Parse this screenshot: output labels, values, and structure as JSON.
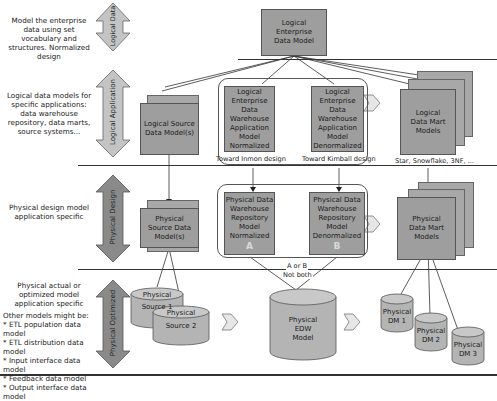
{
  "layers": [
    {
      "id": "logical-data",
      "arrow_label": "Logical Data",
      "arrow_color": "#c4c4c4",
      "description": "Model the enterprise data using set vocabulary and structures. Normalized design"
    },
    {
      "id": "logical-application",
      "arrow_label": "Logical Application",
      "arrow_color": "#c4c4c4",
      "description": "Logical data models for specific applications: data warehouse repository, data marts, source systems..."
    },
    {
      "id": "physical-design",
      "arrow_label": "Physical Design",
      "arrow_color": "#8a8a8a",
      "description": "Physical design model application specific"
    },
    {
      "id": "physical-optimized",
      "arrow_label": "Physical Optimized",
      "arrow_color": "#8a8a8a",
      "description": "Physical actual or optimized model application specific"
    }
  ],
  "other_models": {
    "heading": "Other models might be:",
    "items": [
      "* ETL population data model",
      "* ETL distribution data model",
      "* Input interface data model",
      "* Feedback data model",
      "* Output interface data model"
    ]
  },
  "boxes": {
    "enterprise": "Logical Enterprise Data Model",
    "logical_source": "Logical Source Data Model(s)",
    "logical_edw_norm": "Logical Enterprise Data Warehouse Application Model Normalized",
    "logical_edw_denorm": "Logical Enterprise Data Warehouse Application Model Denormalized",
    "logical_dm": "Logical Data Mart Models",
    "physical_source": "Physical Source Data Model(s)",
    "physical_dw_norm": "Physical Data Warehouse Repository Model Normalized",
    "physical_dw_norm_letter": "A",
    "physical_dw_denorm": "Physical Data Warehouse Repository Model Denormalized",
    "physical_dw_denorm_letter": "B",
    "physical_dm": "Physical Data Mart Models"
  },
  "captions": {
    "inmon": "Toward Inmon design",
    "kimball": "Toward Kimball design",
    "dm_types": "Star, Snowflake, 3NF, ...",
    "a_or_b": "A or B",
    "not_both": "Not both"
  },
  "cylinders": {
    "source1": {
      "line1": "Physical",
      "line2": "Source 1"
    },
    "source2": {
      "line1": "Physical",
      "line2": "Source 2"
    },
    "edw": {
      "line1": "Physical",
      "line2": "EDW",
      "line3": "Model"
    },
    "dm1": {
      "line1": "Physical",
      "line2": "DM 1"
    },
    "dm2": {
      "line1": "Physical",
      "line2": "DM 2"
    },
    "dm3": {
      "line1": "Physical",
      "line2": "DM 3"
    }
  },
  "colors": {
    "box_fill": "#9e9e9e",
    "light_arrow": "#c4c4c4",
    "dark_arrow": "#8a8a8a",
    "cylinder_fill": "#b4b4b4"
  }
}
